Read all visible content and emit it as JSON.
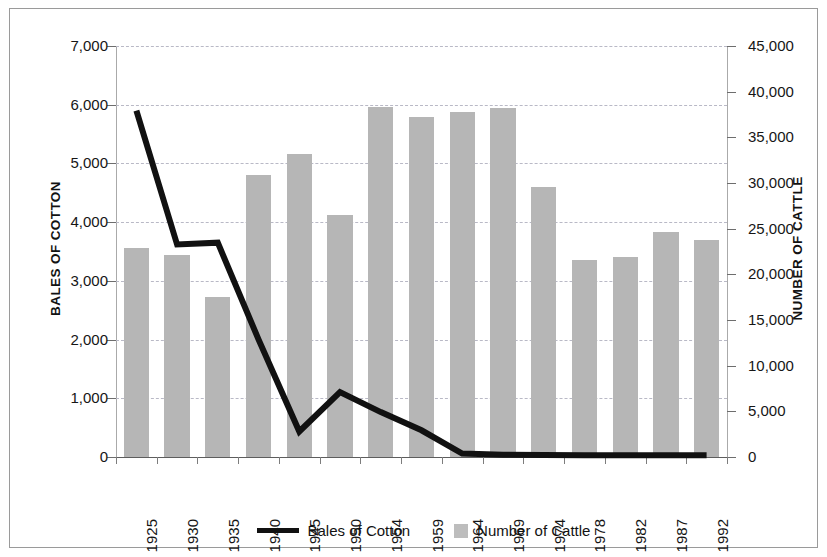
{
  "chart_data": {
    "type": "bar",
    "title": "",
    "subtitle": "",
    "xlabel": "",
    "categories": [
      "1925",
      "1930",
      "1935",
      "1940",
      "1945",
      "1950",
      "1954",
      "1959",
      "1964",
      "1969",
      "1974",
      "1978",
      "1982",
      "1987",
      "1992"
    ],
    "axes": {
      "left": {
        "label": "BALES OF COTTON",
        "min": 0,
        "max": 7000,
        "step": 1000,
        "ticks": [
          "0",
          "1,000",
          "2,000",
          "3,000",
          "4,000",
          "5,000",
          "6,000",
          "7,000"
        ],
        "tick_values": [
          0,
          1000,
          2000,
          3000,
          4000,
          5000,
          6000,
          7000
        ]
      },
      "right": {
        "label": "NUMBER OF CATTLE",
        "min": 0,
        "max": 45000,
        "step": 5000,
        "ticks": [
          "0",
          "5,000",
          "10,000",
          "15,000",
          "20,000",
          "25,000",
          "30,000",
          "35,000",
          "40,000",
          "45,000"
        ],
        "tick_values": [
          0,
          5000,
          10000,
          15000,
          20000,
          25000,
          30000,
          35000,
          40000,
          45000
        ]
      }
    },
    "grid": true,
    "legend_position": "bottom",
    "series": [
      {
        "name": "Bales of Cotton",
        "render": "line",
        "axis": "left",
        "color": "#111111",
        "values": [
          5900,
          3620,
          3650,
          2000,
          435,
          1105,
          765,
          455,
          60,
          40,
          35,
          30,
          30,
          30,
          30
        ]
      },
      {
        "name": "Number of Cattle",
        "render": "bar",
        "axis": "right",
        "color": "#b6b6b6",
        "values": [
          22900,
          22080,
          17500,
          30850,
          33150,
          26450,
          38300,
          37200,
          37800,
          38250,
          29600,
          21550,
          21850,
          24650,
          23800
        ]
      }
    ]
  },
  "legend": {
    "items": [
      {
        "label": "Bales of Cotton",
        "marker": "line-swatch",
        "color": "#111111"
      },
      {
        "label": "Number of Cattle",
        "marker": "box-swatch",
        "color": "#bdbdbd"
      }
    ]
  }
}
